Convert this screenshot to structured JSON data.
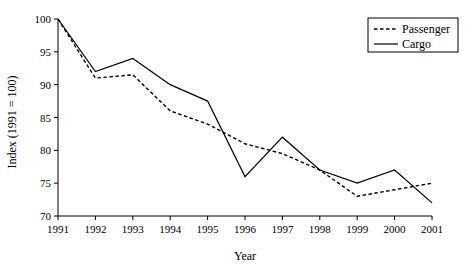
{
  "chart_data": {
    "type": "line",
    "title": "",
    "xlabel": "Year",
    "ylabel": "Index (1991 = 100)",
    "categories": [
      "1991",
      "1992",
      "1993",
      "1994",
      "1995",
      "1996",
      "1997",
      "1998",
      "1999",
      "2000",
      "2001"
    ],
    "x": [
      1991,
      1992,
      1993,
      1994,
      1995,
      1996,
      1997,
      1998,
      1999,
      2000,
      2001
    ],
    "xlim": [
      1991,
      2001
    ],
    "ylim": [
      70,
      100
    ],
    "yticks": [
      70,
      75,
      80,
      85,
      90,
      95,
      100
    ],
    "xticks": [
      "1991",
      "1992",
      "1993",
      "1994",
      "1995",
      "1996",
      "1997",
      "1998",
      "1999",
      "2000",
      "2001"
    ],
    "grid": false,
    "legend_position": "top-right",
    "series": [
      {
        "name": "Passenger",
        "style": "dashed",
        "color": "#000000",
        "values": [
          100,
          91,
          91.5,
          86,
          84,
          81,
          79.5,
          77,
          73,
          74,
          75
        ]
      },
      {
        "name": "Cargo",
        "style": "solid",
        "color": "#000000",
        "values": [
          100,
          92,
          94,
          90,
          87.5,
          76,
          82,
          77,
          75,
          77,
          72
        ]
      }
    ],
    "annotations": []
  },
  "legend": {
    "entries": [
      {
        "label": "Passenger",
        "style": "dashed"
      },
      {
        "label": "Cargo",
        "style": "solid"
      }
    ]
  },
  "axes": {
    "x_title": "Year",
    "y_title": "Index (1991 = 100)",
    "y_tick_labels": [
      "100",
      "95",
      "90",
      "85",
      "80",
      "75",
      "70"
    ],
    "x_tick_labels": [
      "1991",
      "1992",
      "1993",
      "1994",
      "1995",
      "1996",
      "1997",
      "1998",
      "1999",
      "2000",
      "2001"
    ]
  },
  "colors": {
    "background": "#ffffff",
    "ink": "#000000"
  }
}
